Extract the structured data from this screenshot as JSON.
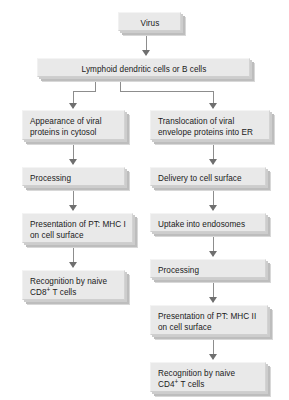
{
  "diagram": {
    "type": "flowchart",
    "orientation": "top-down",
    "style": {
      "box_fill": "#e9e9e9",
      "box_shadow": "#bdbdbd",
      "connector_color": "#8d8d8d",
      "arrowhead_color": "#6f6f6f",
      "background": "#ffffff",
      "text_color": "#1a1a1a"
    },
    "nodes": {
      "virus": {
        "label": "Virus"
      },
      "apc": {
        "label": "Lymphoid dendritic cells or B cells"
      },
      "left_1": {
        "line1": "Appearance of viral",
        "line2": "proteins in cytosol"
      },
      "left_2": {
        "line1": "Processing"
      },
      "left_3": {
        "line1": "Presentation of PT: MHC I",
        "line2": "on cell surface"
      },
      "left_4": {
        "line1": "Recognition by naive",
        "line2_pre": "CD8",
        "line2_sup": "+",
        "line2_post": " T cells"
      },
      "right_1": {
        "line1": "Translocation of viral",
        "line2": "envelope proteins into ER"
      },
      "right_2": {
        "line1": "Delivery to cell surface"
      },
      "right_3": {
        "line1": "Uptake into endosomes"
      },
      "right_4": {
        "line1": "Processing"
      },
      "right_5": {
        "line1": "Presentation of PT: MHC II",
        "line2": "on cell surface"
      },
      "right_6": {
        "line1": "Recognition by naive",
        "line2_pre": "CD4",
        "line2_sup": "+",
        "line2_post": " T cells"
      }
    },
    "branches": {
      "left_pathway_name": "MHC class I pathway",
      "right_pathway_name": "MHC class II pathway"
    }
  }
}
